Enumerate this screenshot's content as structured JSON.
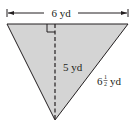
{
  "figure": {
    "type": "triangle",
    "fill_color": "#d4d4d4",
    "stroke_color": "#231f20",
    "labels": {
      "base": "6 yd",
      "height": "5 yd",
      "side_whole": "6",
      "side_frac_num": "1",
      "side_frac_den": "2",
      "side_unit": "yd"
    }
  }
}
